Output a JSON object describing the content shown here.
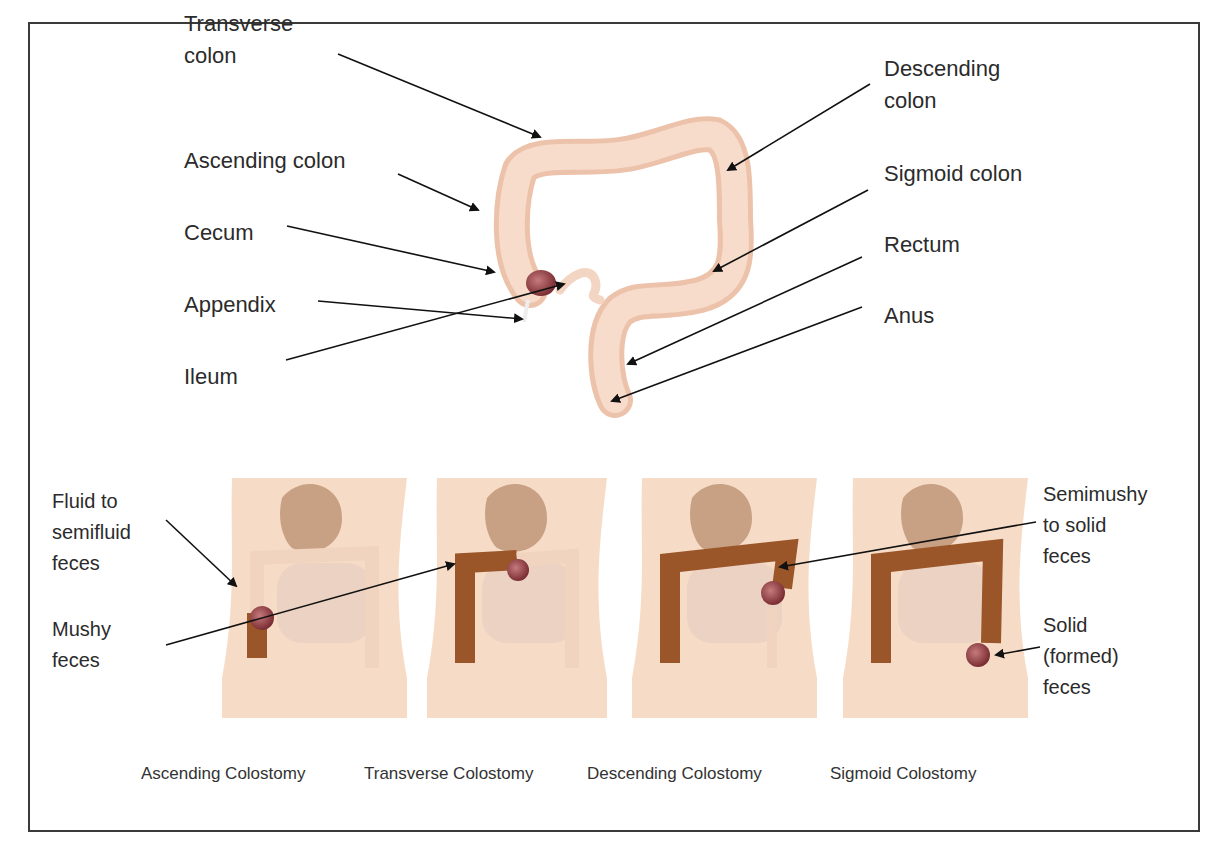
{
  "anatomy_labels": {
    "transverse_colon": "Transverse\ncolon",
    "ascending_colon": "Ascending colon",
    "cecum": "Cecum",
    "appendix": "Appendix",
    "ileum": "Ileum",
    "descending_colon": "Descending\ncolon",
    "sigmoid_colon": "Sigmoid colon",
    "rectum": "Rectum",
    "anus": "Anus"
  },
  "feces_labels": {
    "fluid": "Fluid to\nsemifluid\nfeces",
    "mushy": "Mushy\nfeces",
    "semimushy": "Semimushy\nto solid\nfeces",
    "solid": "Solid\n(formed)\nfeces"
  },
  "captions": [
    "Ascending Colostomy",
    "Transverse Colostomy",
    "Descending Colostomy",
    "Sigmoid Colostomy"
  ],
  "colors": {
    "colon": "#f2cdb8",
    "colon_affected": "#9a5528",
    "stoma": "#8e3b3f",
    "skin": "#f6dcc6",
    "stomach": "#c8a083"
  }
}
